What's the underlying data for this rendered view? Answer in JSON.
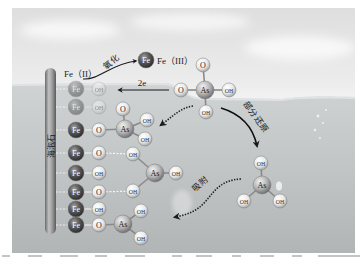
{
  "figure": {
    "substrate_label": "海泡石",
    "oxidation": {
      "from_label": "Fe（II）",
      "process_label": "氧化",
      "product_atom": "Fe",
      "product_label": "Fe（III）"
    },
    "electron_transfer": {
      "label": "2e"
    },
    "reduction": {
      "process_label": "部分还原"
    },
    "adsorption": {
      "process_label": "吸附"
    },
    "surface_rows": [
      {
        "metal": "Fe",
        "ligand": "OH",
        "faded": true
      },
      {
        "metal": "Fe",
        "ligand": "OH",
        "faded": true
      },
      {
        "metal": "Fe",
        "ligand": "O"
      },
      {
        "metal": "Fe",
        "ligand": "O"
      },
      {
        "metal": "Fe",
        "ligand": "OH"
      },
      {
        "metal": "Fe",
        "ligand": "O"
      },
      {
        "metal": "Fe",
        "ligand": "OH"
      },
      {
        "metal": "Fe",
        "ligand": "O"
      }
    ],
    "molecules": {
      "arsenate_solution": {
        "center": "As",
        "ligands": [
          "O",
          "O",
          "OH",
          "OH"
        ]
      },
      "arsenate_monodentate": {
        "center": "As",
        "ligands": [
          "O",
          "OH",
          "OH"
        ]
      },
      "arsenite_bidentate": {
        "center": "As",
        "ligands": [
          "OH",
          "OH",
          "OH"
        ]
      },
      "arsenite_monodentate": {
        "center": "As",
        "ligands": [
          "OH",
          "OH"
        ]
      },
      "arsenite_solution": {
        "center": "As",
        "ligands": [
          "OH",
          "OH",
          "OH"
        ]
      }
    }
  }
}
